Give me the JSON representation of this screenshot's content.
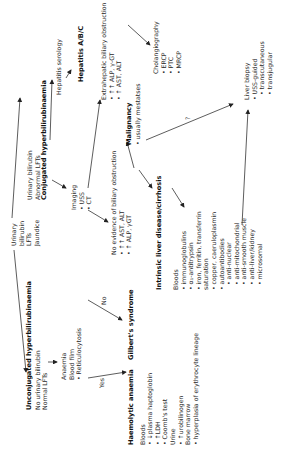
{
  "diagram": {
    "root": {
      "lines": [
        "Urinary",
        "bilirubin",
        "LFTs",
        "Jaundice"
      ]
    },
    "unconjugated": {
      "title": "Unconjugated hyperbilirubinaemia",
      "lines": [
        "No urinary bilirubin",
        "Normal LFTs"
      ]
    },
    "anaemia_tests": {
      "lines": [
        "Anaemia",
        "Blood film"
      ],
      "bullets": [
        "Reticulocytosis"
      ]
    },
    "yes_label": "Yes",
    "no_label": "No",
    "haemolytic": {
      "title": "Haemolytic anaemia"
    },
    "haemolytic_tests": {
      "bloods_label": "Bloods",
      "bloods": [
        "↓plasma haptoglobin",
        "↑LDH",
        "Coomb's test"
      ],
      "urine_label": "Urine",
      "urine": [
        "↑urobilinogen"
      ],
      "marrow_label": "Bone marrow",
      "marrow": [
        "hyperplasia of erythrocyte lineage"
      ]
    },
    "gilberts": {
      "title": "Gilbert's syndrome"
    },
    "conjugated": {
      "lines": [
        "Urinary bilirubin",
        "Abnormal LFTs"
      ],
      "title": "Conjugated hyperbilirubinaemia"
    },
    "hepatitis_serology": {
      "label": "Hepatitis serology"
    },
    "hepatitis_abc": {
      "title": "Hepatitis A/B/C"
    },
    "imaging": {
      "label": "Imaging",
      "bullets": [
        "USS",
        "CT"
      ]
    },
    "extrahepatic": {
      "label": "Extrahepatic biliary obstruction",
      "bullets": [
        "↑↑ ALP, γ-GT",
        "↑ AST, ALT"
      ]
    },
    "cholangiography": {
      "label": "Cholangiography",
      "bullets": [
        "ERCP",
        "PTC",
        "MRCP"
      ]
    },
    "no_obstruction": {
      "label": "No evidence of biliary obstruction",
      "bullets": [
        "↑↑ AST, ALT",
        "↑ ALP, γGT"
      ]
    },
    "malignancy": {
      "title": "Malignancy",
      "bullets": [
        "usually mestatses"
      ]
    },
    "question_label": "?",
    "liver_biopsy": {
      "label": "Liver biopsy",
      "bullets": [
        "USS-guided"
      ],
      "sub": [
        "transcutaneous",
        "transjugular"
      ]
    },
    "intrinsic": {
      "title": "Intrinsic liver disease/cirrhosis"
    },
    "intrinsic_tests": {
      "bloods_label": "Bloods",
      "bullets": [
        "immunoglobulins",
        "α₁-antitrypsin",
        "iron, ferritin, transferrin",
        "copper, caeruloplasmin",
        "autoantibodies"
      ],
      "saturation": "saturation",
      "autoantibodies": [
        "anti-nuclear",
        "anti-mitochondrial",
        "anti-smooth muscle",
        "anti-liver/kidney",
        "microsomal"
      ]
    }
  }
}
